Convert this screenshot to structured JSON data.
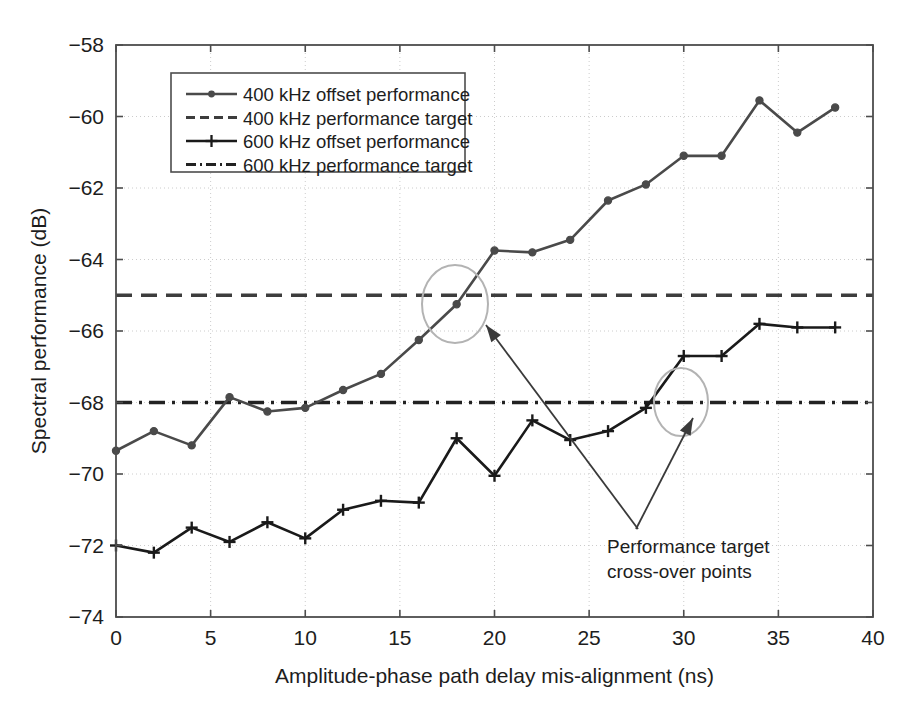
{
  "figure": {
    "background_color": "#ffffff",
    "axis_color": "#4d4d4d",
    "grid_color": "#cccccc",
    "series_color_400": "#4a4a4a",
    "series_color_600": "#1a1a1a",
    "target_color_400": "#3d3d3d",
    "target_color_600": "#222222",
    "annotation_circle_color": "#b3b3b3",
    "annotation_arrow_color": "#3a3a3a"
  },
  "chart_data": {
    "type": "line",
    "title": "",
    "subtitle": "",
    "xlabel": "Amplitude-phase path delay mis-alignment (ns)",
    "ylabel": "Spectral performance (dB)",
    "xlim": [
      0,
      40
    ],
    "ylim": [
      -74,
      -58
    ],
    "xticks": [
      0,
      5,
      10,
      15,
      20,
      25,
      30,
      35,
      40
    ],
    "yticks": [
      -74,
      -72,
      -70,
      -68,
      -66,
      -64,
      -62,
      -60,
      -58
    ],
    "xticklabels": [
      "0",
      "5",
      "10",
      "15",
      "20",
      "25",
      "30",
      "35",
      "40"
    ],
    "yticklabels": [
      "−74",
      "−72",
      "−70",
      "−68",
      "−66",
      "−64",
      "−62",
      "−60",
      "−58"
    ],
    "grid": true,
    "grid_style": "dotted",
    "legend_position": "upper left",
    "x": [
      0,
      2,
      4,
      6,
      8,
      10,
      12,
      14,
      16,
      18,
      20,
      22,
      24,
      26,
      28,
      30,
      32,
      34,
      36,
      38
    ],
    "series": [
      {
        "name": "400 kHz offset performance",
        "style": "solid",
        "marker": "circle",
        "values": [
          -69.35,
          -68.8,
          -69.2,
          -67.85,
          -68.25,
          -68.15,
          -67.65,
          -67.2,
          -66.25,
          -65.25,
          -63.75,
          -63.8,
          -63.45,
          -62.35,
          -61.9,
          -61.1,
          -61.1,
          -59.55,
          -60.45,
          -59.75
        ]
      },
      {
        "name": "600 kHz offset performance",
        "style": "solid",
        "marker": "plus",
        "values": [
          -72.0,
          -72.2,
          -71.5,
          -71.9,
          -71.35,
          -71.8,
          -71.0,
          -70.75,
          -70.8,
          -69.0,
          -70.05,
          -68.5,
          -69.05,
          -68.8,
          -68.15,
          -66.7,
          -66.7,
          -65.8,
          -65.9,
          -65.9
        ]
      }
    ],
    "reference_lines": [
      {
        "name": "400 kHz performance target",
        "value": -65.0,
        "style": "dashed"
      },
      {
        "name": "600 kHz performance target",
        "value": -68.0,
        "style": "dashdot"
      }
    ],
    "annotations": [
      {
        "text_line1": "Performance target",
        "text_line2": "cross-over points",
        "markers": [
          "circle-highlight-400",
          "circle-highlight-600"
        ]
      }
    ]
  },
  "legend": {
    "entries": [
      {
        "label": "400 kHz offset performance",
        "style": "solid",
        "marker": "circle"
      },
      {
        "label": "400 kHz performance target",
        "style": "dashed",
        "marker": "none"
      },
      {
        "label": "600 kHz offset performance",
        "style": "solid",
        "marker": "plus"
      },
      {
        "label": "600 kHz performance target",
        "style": "dashdot",
        "marker": "none"
      }
    ]
  },
  "axes": {
    "x_title": "Amplitude-phase path delay mis-alignment (ns)",
    "y_title": "Spectral performance (dB)",
    "x_tick_labels": [
      "0",
      "5",
      "10",
      "15",
      "20",
      "25",
      "30",
      "35",
      "40"
    ],
    "y_tick_labels": [
      "−58",
      "−60",
      "−62",
      "−64",
      "−66",
      "−68",
      "−70",
      "−72",
      "−74"
    ]
  },
  "annotation": {
    "line1": "Performance target",
    "line2": "cross-over points"
  }
}
